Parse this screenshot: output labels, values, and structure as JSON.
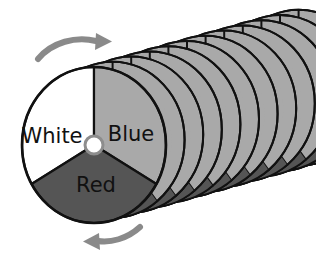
{
  "figure": {
    "background_color": "#ffffff",
    "width": 316,
    "height": 258
  },
  "disc": {
    "center": {
      "x": 94,
      "y": 145
    },
    "radius_x": 72,
    "radius_y": 78,
    "outline_color": "#111111",
    "outline_width": 2.2,
    "hub": {
      "name": "center-hub",
      "radius": 9,
      "fill": "#ffffff",
      "ring_color": "#8d8d8d",
      "ring_width": 3
    },
    "sectors": [
      {
        "name": "white-sector",
        "label": "White",
        "fill": "#ffffff",
        "start_angle_deg": 150,
        "end_angle_deg": 270,
        "label_x": 52,
        "label_y": 143
      },
      {
        "name": "blue-sector",
        "label": "Blue",
        "fill": "#a9a9a9",
        "start_angle_deg": 270,
        "end_angle_deg": 30,
        "label_x": 131,
        "label_y": 141
      },
      {
        "name": "red-sector",
        "label": "Red",
        "fill": "#555555",
        "start_angle_deg": 30,
        "end_angle_deg": 150,
        "label_x": 96,
        "label_y": 192
      }
    ]
  },
  "stack": {
    "name": "receding-disc-stack",
    "copy_count": 11,
    "offset_x": 18.6,
    "offset_y": -5.2,
    "body_fill": "#a9a9a9",
    "shadow_fill": "#555555",
    "outline_color": "#111111",
    "outline_width": 2.0
  },
  "arrows": [
    {
      "name": "rotation-arrow-top",
      "direction": "right",
      "color": "#8a8a8a",
      "stroke_width": 6,
      "path": "M 38,59 C 52,42 76,36 96,41",
      "head_points": "96,33 112,41.5 95,50"
    },
    {
      "name": "rotation-arrow-bottom",
      "direction": "left",
      "color": "#8a8a8a",
      "stroke_width": 6,
      "path": "M 140,227 C 127,239 110,243 98,241",
      "head_points": "99,233 83,241.5 100,250"
    }
  ]
}
